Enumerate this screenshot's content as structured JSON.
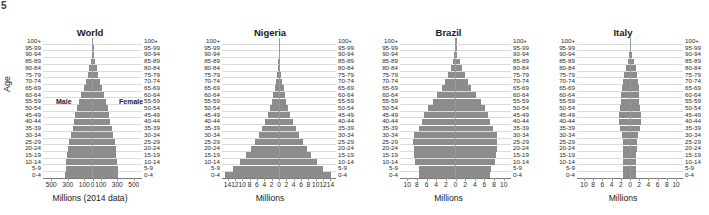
{
  "corner_mark": "5",
  "axis": {
    "age_label": "Age",
    "age_groups": [
      "100+",
      "95-99",
      "90-94",
      "85-89",
      "80-84",
      "75-79",
      "70-74",
      "65-69",
      "60-64",
      "55-59",
      "50-54",
      "45-49",
      "40-44",
      "35-39",
      "30-34",
      "25-29",
      "20-24",
      "15-19",
      "10-14",
      "5-9",
      "0-4"
    ]
  },
  "annotations": {
    "male": "Male",
    "female": "Female"
  },
  "chart_data": [
    {
      "type": "bar",
      "title": "World",
      "xlabel": "Millions (2014 data)",
      "ylabel": "Age",
      "unit": "millions",
      "grid": true,
      "legend": "none",
      "orientation": "population-pyramid",
      "xlim": [
        -600,
        600
      ],
      "xticks": [
        500,
        300,
        100,
        0,
        100,
        300,
        500
      ],
      "xtick_values": [
        -500,
        -300,
        -100,
        0,
        100,
        300,
        500
      ],
      "categories": [
        "0-4",
        "5-9",
        "10-14",
        "15-19",
        "20-24",
        "25-29",
        "30-34",
        "35-39",
        "40-44",
        "45-49",
        "50-54",
        "55-59",
        "60-64",
        "65-69",
        "70-74",
        "75-79",
        "80-84",
        "85-89",
        "90-94",
        "95-99",
        "100+"
      ],
      "series": [
        {
          "name": "Male",
          "side": "left",
          "values": [
            330,
            325,
            318,
            305,
            300,
            290,
            265,
            240,
            225,
            210,
            190,
            160,
            135,
            105,
            80,
            58,
            38,
            20,
            8,
            2,
            0.4
          ]
        },
        {
          "name": "Female",
          "side": "right",
          "values": [
            310,
            305,
            298,
            287,
            283,
            276,
            254,
            232,
            218,
            205,
            188,
            162,
            140,
            113,
            92,
            70,
            50,
            30,
            13,
            4,
            0.8
          ]
        }
      ]
    },
    {
      "type": "bar",
      "title": "Nigeria",
      "xlabel": "Millions",
      "ylabel": "Age",
      "unit": "millions",
      "grid": true,
      "legend": "none",
      "orientation": "population-pyramid",
      "xlim": [
        -15.5,
        15.5
      ],
      "xticks": [
        14,
        12,
        10,
        8,
        6,
        4,
        2,
        0,
        2,
        4,
        6,
        8,
        10,
        12,
        14
      ],
      "xtick_values": [
        -14,
        -12,
        -10,
        -8,
        -6,
        -4,
        -2,
        0,
        2,
        4,
        6,
        8,
        10,
        12,
        14
      ],
      "categories": [
        "0-4",
        "5-9",
        "10-14",
        "15-19",
        "20-24",
        "25-29",
        "30-34",
        "35-39",
        "40-44",
        "45-49",
        "50-54",
        "55-59",
        "60-64",
        "65-69",
        "70-74",
        "75-79",
        "80-84",
        "85-89",
        "90-94",
        "95-99",
        "100+"
      ],
      "series": [
        {
          "name": "Male",
          "side": "left",
          "values": [
            14.6,
            12.5,
            10.6,
            9.0,
            7.6,
            6.5,
            5.5,
            4.6,
            3.8,
            3.1,
            2.5,
            2.0,
            1.6,
            1.2,
            0.85,
            0.55,
            0.32,
            0.15,
            0.05,
            0.01,
            0.002
          ]
        },
        {
          "name": "Female",
          "side": "right",
          "values": [
            14.2,
            12.1,
            10.3,
            8.8,
            7.5,
            6.4,
            5.4,
            4.5,
            3.8,
            3.1,
            2.5,
            2.0,
            1.6,
            1.25,
            0.9,
            0.6,
            0.36,
            0.18,
            0.06,
            0.012,
            0.002
          ]
        }
      ]
    },
    {
      "type": "bar",
      "title": "Brazil",
      "xlabel": "Millions",
      "ylabel": "Age",
      "unit": "millions",
      "grid": true,
      "legend": "none",
      "orientation": "population-pyramid",
      "xlim": [
        -11.5,
        11.5
      ],
      "xticks": [
        10,
        8,
        6,
        4,
        2,
        0,
        2,
        4,
        6,
        8,
        10
      ],
      "xtick_values": [
        -10,
        -8,
        -6,
        -4,
        -2,
        0,
        2,
        4,
        6,
        8,
        10
      ],
      "categories": [
        "0-4",
        "5-9",
        "10-14",
        "15-19",
        "20-24",
        "25-29",
        "30-34",
        "35-39",
        "40-44",
        "45-49",
        "50-54",
        "55-59",
        "60-64",
        "65-69",
        "70-74",
        "75-79",
        "80-84",
        "85-89",
        "90-94",
        "95-99",
        "100+"
      ],
      "series": [
        {
          "name": "Male",
          "side": "left",
          "values": [
            7.5,
            7.6,
            8.4,
            8.6,
            8.7,
            8.8,
            8.6,
            7.6,
            7.0,
            6.5,
            5.7,
            4.7,
            3.8,
            2.8,
            2.1,
            1.5,
            1.0,
            0.55,
            0.22,
            0.06,
            0.01
          ]
        },
        {
          "name": "Female",
          "side": "right",
          "values": [
            7.2,
            7.3,
            8.1,
            8.3,
            8.5,
            8.7,
            8.6,
            7.7,
            7.2,
            6.8,
            6.1,
            5.2,
            4.3,
            3.3,
            2.6,
            1.9,
            1.4,
            0.85,
            0.38,
            0.11,
            0.02
          ]
        }
      ]
    },
    {
      "type": "bar",
      "title": "Italy",
      "xlabel": "Millions",
      "ylabel": "Age",
      "unit": "millions",
      "grid": true,
      "legend": "none",
      "orientation": "population-pyramid",
      "xlim": [
        -11.5,
        11.5
      ],
      "xticks": [
        10,
        8,
        6,
        4,
        2,
        0,
        2,
        4,
        6,
        8,
        10
      ],
      "xtick_values": [
        -10,
        -8,
        -6,
        -4,
        -2,
        0,
        2,
        4,
        6,
        8,
        10
      ],
      "categories": [
        "0-4",
        "5-9",
        "10-14",
        "15-19",
        "20-24",
        "25-29",
        "30-34",
        "35-39",
        "40-44",
        "45-49",
        "50-54",
        "55-59",
        "60-64",
        "65-69",
        "70-74",
        "75-79",
        "80-84",
        "85-89",
        "90-94",
        "95-99",
        "100+"
      ],
      "series": [
        {
          "name": "Male",
          "side": "left",
          "values": [
            1.45,
            1.45,
            1.43,
            1.42,
            1.5,
            1.62,
            1.82,
            2.15,
            2.35,
            2.4,
            2.2,
            1.95,
            1.85,
            1.75,
            1.55,
            1.25,
            0.9,
            0.5,
            0.18,
            0.03,
            0.004
          ]
        },
        {
          "name": "Female",
          "side": "right",
          "values": [
            1.38,
            1.38,
            1.36,
            1.35,
            1.44,
            1.57,
            1.8,
            2.12,
            2.35,
            2.42,
            2.25,
            2.02,
            1.95,
            1.88,
            1.75,
            1.55,
            1.25,
            0.8,
            0.35,
            0.08,
            0.012
          ]
        }
      ]
    }
  ]
}
